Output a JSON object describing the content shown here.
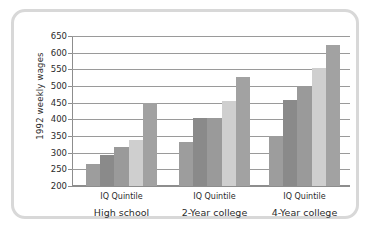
{
  "chart_data": {
    "type": "bar",
    "title": "",
    "xlabel": "IQ Quintile",
    "ylabel": "1992 weekly wages",
    "ylim": [
      200,
      650
    ],
    "ytick_step": 50,
    "yticks": [
      200,
      250,
      300,
      350,
      400,
      450,
      500,
      550,
      600,
      650
    ],
    "grid": true,
    "legend": "none",
    "groups": [
      "High school",
      "2-Year college",
      "4-Year college"
    ],
    "group_axis_label": "IQ Quintile",
    "categories": [
      "1",
      "2",
      "3",
      "4",
      "5"
    ],
    "series": [
      {
        "name": "High school",
        "values": [
          265,
          293,
          318,
          338,
          448
        ]
      },
      {
        "name": "2-Year college",
        "values": [
          332,
          405,
          404,
          455,
          527
        ]
      },
      {
        "name": "4-Year college",
        "values": [
          350,
          458,
          497,
          553,
          622
        ]
      }
    ],
    "bar_colors": [
      "#9d9d9d",
      "#8a8a8a",
      "#9a9a9a",
      "#cfcfcf",
      "#a2a2a2"
    ],
    "gridline_color": "#9a9a9a",
    "axis_color": "#8d8d8d",
    "frame_color": "#d8d8d8",
    "background_color": "#ffffff"
  },
  "axis": {
    "y_title": "1992 weekly wages",
    "y_labels": [
      "650",
      "600",
      "550",
      "500",
      "450",
      "400",
      "350",
      "300",
      "250",
      "200"
    ]
  },
  "x_labels": {
    "quintile": "IQ Quintile",
    "groups": [
      "High school",
      "2-Year college",
      "4-Year college"
    ]
  }
}
